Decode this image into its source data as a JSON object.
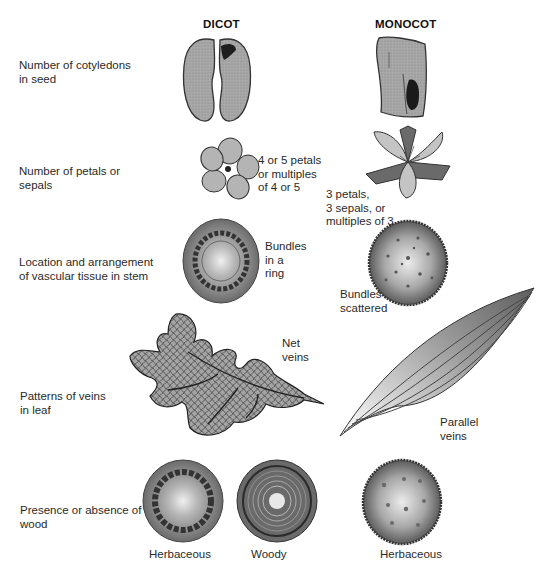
{
  "columns": {
    "dicot": "DICOT",
    "monocot": "MONOCOT"
  },
  "rows": [
    {
      "label": "Number of cotyledons\nin seed",
      "dicot_note": "",
      "monocot_note": ""
    },
    {
      "label": "Number of petals or\nsepals",
      "dicot_note": "4  or 5 petals\nor multiples\nof 4 or 5",
      "monocot_note": "3  petals,\n3 sepals, or\nmultiples of 3"
    },
    {
      "label": "Location and arrangement\nof vascular tissue in stem",
      "dicot_note": "Bundles\nin a\nring",
      "monocot_note": "Bundles\nscattered"
    },
    {
      "label": "Patterns of veins\nin leaf",
      "dicot_note": "Net\nveins",
      "monocot_note": "Parallel\nveins"
    },
    {
      "label": "Presence or absence of\nwood",
      "dicot_captions": [
        "Herbaceous",
        "Woody"
      ],
      "monocot_captions": [
        "Herbaceous"
      ]
    }
  ],
  "colors": {
    "illustration_fill": "#9a9a9a",
    "illustration_dark": "#4a4a4a",
    "illustration_light": "#d8d8d8",
    "text": "#2a2a2a"
  }
}
